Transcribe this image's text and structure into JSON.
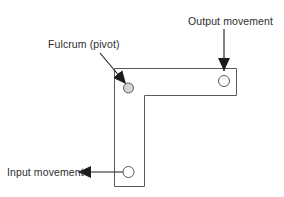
{
  "diagram": {
    "name": "bell-crank-lever-diagram",
    "labels": {
      "output": "Output movement",
      "fulcrum": "Fulcrum (pivot)",
      "input": "Input movement"
    },
    "colors": {
      "background": "#ffffff",
      "outline": "#5a5a5a",
      "arrow": "#1d1d1d",
      "text": "#2e2e2e",
      "fulcrum_hole_fill": "#d4d4d4",
      "end_hole_fill": "#ffffff"
    }
  }
}
